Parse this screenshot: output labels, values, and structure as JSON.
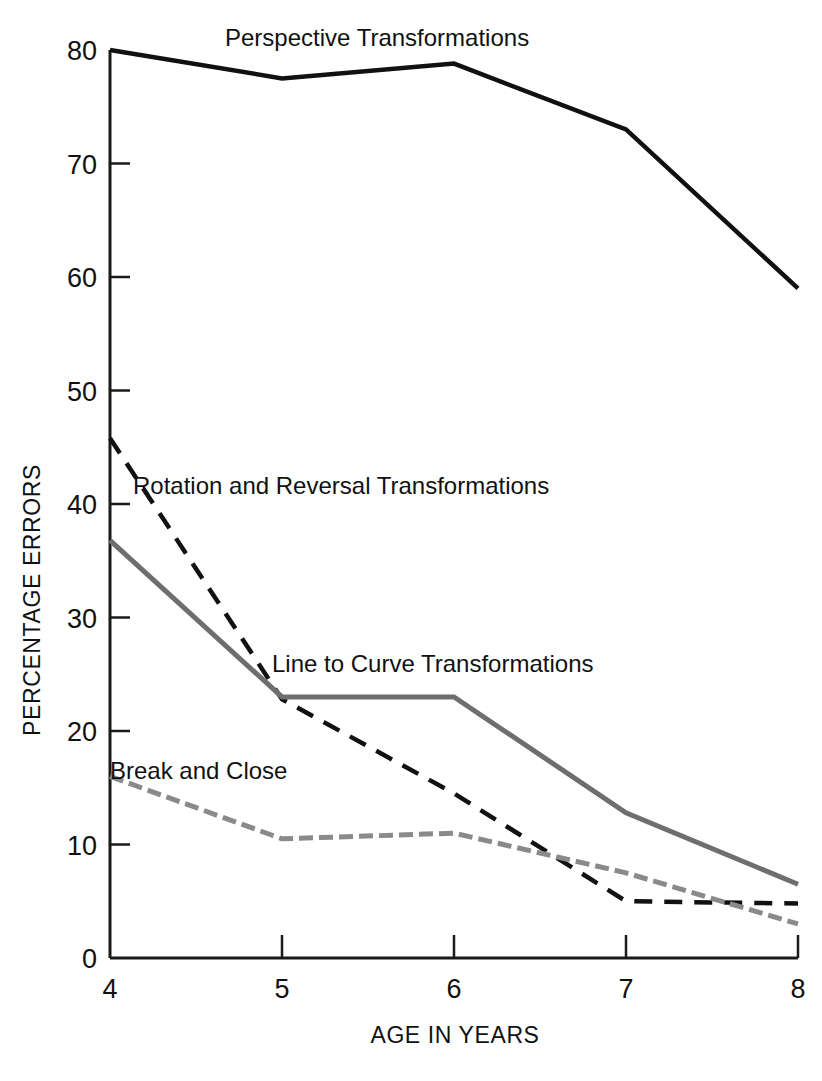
{
  "chart_data": {
    "type": "line",
    "title": "",
    "xlabel": "AGE IN YEARS",
    "ylabel": "PERCENTAGE ERRORS",
    "x": [
      4,
      5,
      6,
      7,
      8
    ],
    "xtick_labels": [
      "4",
      "5",
      "6",
      "7",
      "8"
    ],
    "ytick_labels": [
      "0",
      "10",
      "20",
      "30",
      "40",
      "50",
      "60",
      "70",
      "80"
    ],
    "yticks": [
      0,
      10,
      20,
      30,
      40,
      50,
      60,
      70,
      80
    ],
    "xlim": [
      4,
      8
    ],
    "ylim": [
      0,
      80
    ],
    "grid": false,
    "legend_position": "inline-labels",
    "series": [
      {
        "name": "Perspective Transformations",
        "values": [
          80,
          77.5,
          78.8,
          73,
          59
        ],
        "color": "#111111",
        "style": "solid",
        "width": 4.5
      },
      {
        "name": "Rotation and Reversal Transformations",
        "values": [
          45.8,
          22.8,
          14.5,
          5,
          4.8
        ],
        "color": "#111111",
        "style": "dashed",
        "width": 4.5
      },
      {
        "name": "Line to Curve Transformations",
        "values": [
          36.8,
          23,
          23,
          12.8,
          6.5
        ],
        "color": "#6e6e6e",
        "style": "solid",
        "width": 5
      },
      {
        "name": "Break and Close",
        "values": [
          16,
          10.5,
          11,
          7.5,
          3
        ],
        "color": "#8a8a8a",
        "style": "dotted-dash",
        "width": 5
      }
    ],
    "annotations": [
      {
        "text": "Perspective Transformations",
        "x": 225,
        "y": 46
      },
      {
        "text": "Rotation and Reversal Transformations",
        "x": 133,
        "y": 494
      },
      {
        "text": "Line to Curve Transformations",
        "x": 272,
        "y": 672
      },
      {
        "text": "Break and Close",
        "x": 110,
        "y": 779
      }
    ]
  },
  "axes": {
    "y_title": "PERCENTAGE ERRORS",
    "x_title": "AGE IN YEARS"
  }
}
